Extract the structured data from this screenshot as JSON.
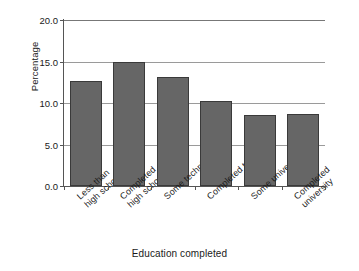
{
  "chart_data": {
    "type": "bar",
    "title": "",
    "xlabel": "Education completed",
    "ylabel": "Percentage",
    "categories": [
      "Less than\nhigh school",
      "Completed\nhigh school",
      "Some technical",
      "Completed tech",
      "Some university",
      "Completed\nuniversity"
    ],
    "values": [
      12.6,
      15.0,
      13.1,
      10.2,
      8.6,
      8.7
    ],
    "ylim": [
      0.0,
      20.0
    ],
    "yticks": [
      "0.0",
      "5.0",
      "10.0",
      "15.0",
      "20.0"
    ],
    "ytick_values": [
      0.0,
      5.0,
      10.0,
      15.0,
      20.0
    ],
    "grid": "horizontal",
    "legend": "none",
    "bar_color": "#666666",
    "bar_edge_color": "#3a3a3a",
    "gridline_color": "#9a9a9a",
    "axis_color": "#555555"
  }
}
